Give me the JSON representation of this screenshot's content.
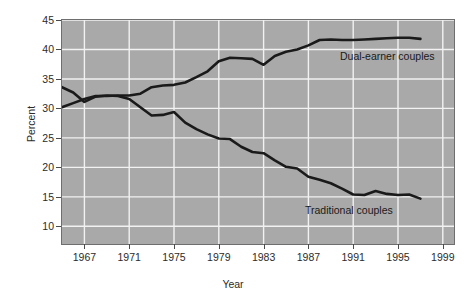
{
  "chart_data": {
    "type": "line",
    "title": "",
    "xlabel": "Year",
    "ylabel": "Percent",
    "xlim": [
      1965,
      2000
    ],
    "ylim": [
      7,
      45
    ],
    "grid": true,
    "legend_position": "inline-annotation",
    "xticks": [
      "1967",
      "1971",
      "1975",
      "1979",
      "1983",
      "1987",
      "1991",
      "1995",
      "1999"
    ],
    "xtick_values": [
      1967,
      1971,
      1975,
      1979,
      1983,
      1987,
      1991,
      1995,
      1999
    ],
    "yticks": [
      "45",
      "40",
      "35",
      "30",
      "25",
      "20",
      "15",
      "10"
    ],
    "ytick_values": [
      45,
      40,
      35,
      30,
      25,
      20,
      15,
      10
    ],
    "series": [
      {
        "name": "Dual-earner couples",
        "color": "#1a1a1a",
        "x": [
          1965,
          1966,
          1967,
          1968,
          1969,
          1970,
          1971,
          1972,
          1973,
          1974,
          1975,
          1976,
          1977,
          1978,
          1979,
          1980,
          1981,
          1982,
          1983,
          1984,
          1985,
          1986,
          1987,
          1988,
          1989,
          1990,
          1991,
          1992,
          1993,
          1994,
          1995,
          1996,
          1997
        ],
        "values": [
          30.2,
          30.9,
          31.6,
          32.1,
          32.1,
          32.2,
          32.2,
          32.5,
          33.6,
          33.9,
          34.0,
          34.4,
          35.3,
          36.3,
          38.0,
          38.6,
          38.5,
          38.4,
          37.4,
          38.9,
          39.6,
          40.0,
          40.7,
          41.6,
          41.7,
          41.6,
          41.6,
          41.7,
          41.8,
          41.9,
          42.0,
          42.0,
          41.8
        ]
      },
      {
        "name": "Traditional couples",
        "color": "#1a1a1a",
        "x": [
          1965,
          1966,
          1967,
          1968,
          1969,
          1970,
          1971,
          1972,
          1973,
          1974,
          1975,
          1976,
          1977,
          1978,
          1979,
          1980,
          1981,
          1982,
          1983,
          1984,
          1985,
          1986,
          1987,
          1988,
          1989,
          1990,
          1991,
          1992,
          1993,
          1994,
          1995,
          1996,
          1997
        ],
        "values": [
          33.6,
          32.7,
          31.1,
          32.0,
          32.2,
          32.1,
          31.6,
          30.2,
          28.8,
          28.9,
          29.4,
          27.6,
          26.5,
          25.6,
          24.9,
          24.8,
          23.5,
          22.6,
          22.4,
          21.2,
          20.1,
          19.8,
          18.4,
          17.9,
          17.3,
          16.4,
          15.4,
          15.3,
          16.0,
          15.5,
          15.3,
          15.4,
          14.7
        ]
      }
    ],
    "annotations": [
      {
        "text": "Dual-earner couples",
        "x": 340,
        "y": 50
      },
      {
        "text": "Traditional couples",
        "x": 305,
        "y": 204
      }
    ]
  }
}
